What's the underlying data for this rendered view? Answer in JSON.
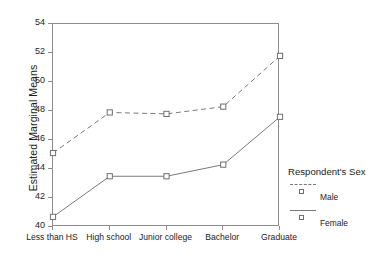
{
  "chart_data": {
    "type": "line",
    "title": "",
    "xlabel": "",
    "ylabel": "Estimated Marginal Means",
    "categories": [
      "Less than HS",
      "High school",
      "Junior college",
      "Bachelor",
      "Graduate"
    ],
    "series": [
      {
        "name": "Male",
        "values": [
          45.1,
          47.9,
          47.8,
          48.3,
          51.8
        ],
        "linestyle": "dashed",
        "marker": "square-open"
      },
      {
        "name": "Female",
        "values": [
          40.7,
          43.5,
          43.5,
          44.3,
          47.6
        ],
        "linestyle": "solid",
        "marker": "square-open"
      }
    ],
    "ylim": [
      40,
      54
    ],
    "ytick_labels": [
      "54",
      "52",
      "50",
      "48",
      "46",
      "44",
      "42",
      "40"
    ],
    "ytick_values": [
      54,
      52,
      50,
      48,
      46,
      44,
      42,
      40
    ],
    "grid": false,
    "legend_position": "right",
    "legend_title": "Respondent's Sex",
    "colors": {
      "line": "#7a7a7a",
      "axis": "#8d8d8d",
      "text": "#1d1d1d",
      "background": "#ffffff"
    }
  },
  "legend": {
    "title": "Respondent's Sex",
    "entries": [
      {
        "label": "Male"
      },
      {
        "label": "Female"
      }
    ]
  }
}
